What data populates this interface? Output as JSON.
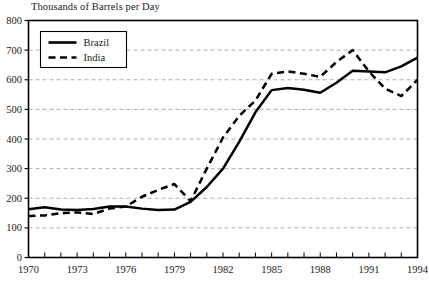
{
  "chart_data": {
    "type": "line",
    "title": "Thousands of Barrels per Day",
    "xlabel": "",
    "ylabel": "",
    "xlim": [
      1970,
      1994
    ],
    "ylim": [
      0,
      800
    ],
    "ytick_step": 100,
    "xtick_step": 1,
    "xlabel_step": 3,
    "grid": "horizontal-dashed",
    "legend_position": "top-left-inside",
    "yticks": [
      "0",
      "100",
      "200",
      "300",
      "400",
      "500",
      "600",
      "700",
      "800"
    ],
    "xticks": [
      "1970",
      "1973",
      "1976",
      "1979",
      "1982",
      "1985",
      "1988",
      "1991",
      "1994"
    ],
    "x": [
      1970,
      1971,
      1972,
      1973,
      1974,
      1975,
      1976,
      1977,
      1978,
      1979,
      1980,
      1981,
      1982,
      1983,
      1984,
      1985,
      1986,
      1987,
      1988,
      1989,
      1990,
      1991,
      1992,
      1993,
      1994
    ],
    "series": [
      {
        "name": "Brazil",
        "style": "solid",
        "color": "#000000",
        "values": [
          163,
          170,
          162,
          160,
          164,
          172,
          172,
          165,
          160,
          162,
          188,
          238,
          300,
          390,
          490,
          565,
          572,
          566,
          556,
          590,
          630,
          628,
          625,
          645,
          675
        ]
      },
      {
        "name": "India",
        "style": "dashed",
        "color": "#000000",
        "values": [
          140,
          142,
          150,
          152,
          147,
          165,
          172,
          205,
          228,
          248,
          190,
          300,
          405,
          478,
          530,
          620,
          628,
          620,
          610,
          660,
          700,
          628,
          570,
          545,
          600
        ]
      }
    ]
  },
  "legend": {
    "items": [
      {
        "label": "Brazil",
        "style": "solid"
      },
      {
        "label": "India",
        "style": "dashed"
      }
    ]
  }
}
